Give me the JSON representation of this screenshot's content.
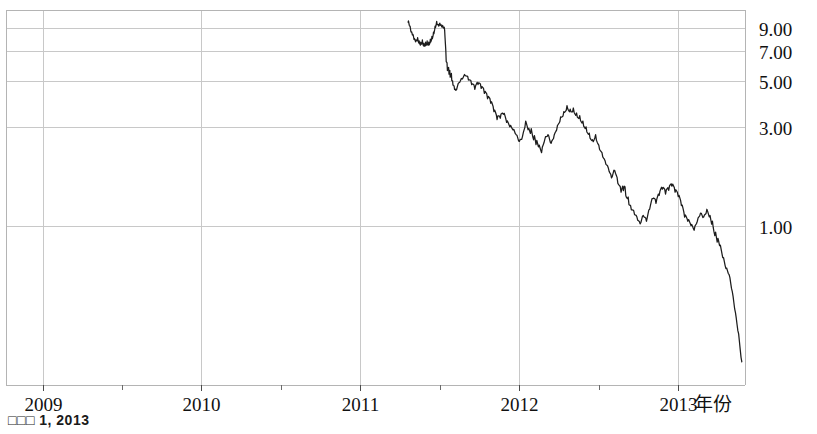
{
  "caption": {
    "text": "□□□ 1, 2013"
  },
  "chart_data": {
    "type": "line",
    "title": "",
    "subtitle": "",
    "xlabel": "年份",
    "ylabel": "",
    "yscale": "log",
    "grid": true,
    "legend": null,
    "xlim": [
      2008.77,
      2013.42
    ],
    "ylim": [
      0.17,
      11.0
    ],
    "x_tick_labels": [
      "2009",
      "2010",
      "2011",
      "2012",
      "2013"
    ],
    "x_tick_values": [
      2009,
      2010,
      2011,
      2012,
      2013
    ],
    "x_minor_ticks": [
      2009.5,
      2010.5,
      2011.5,
      2012.5
    ],
    "y_tick_labels": [
      "9.00",
      "7.00",
      "5.00",
      "3.00",
      "1.00"
    ],
    "y_tick_values": [
      9.0,
      7.0,
      5.0,
      3.0,
      1.0
    ],
    "series": [
      {
        "name": "price",
        "color": "#1c1c1c",
        "x": [
          2011.3,
          2011.31,
          2011.32,
          2011.33,
          2011.34,
          2011.35,
          2011.36,
          2011.37,
          2011.38,
          2011.39,
          2011.4,
          2011.41,
          2011.42,
          2011.43,
          2011.44,
          2011.45,
          2011.46,
          2011.47,
          2011.48,
          2011.49,
          2011.5,
          2011.51,
          2011.52,
          2011.53,
          2011.54,
          2011.55,
          2011.56,
          2011.57,
          2011.58,
          2011.59,
          2011.6,
          2011.62,
          2011.64,
          2011.66,
          2011.68,
          2011.7,
          2011.72,
          2011.74,
          2011.76,
          2011.78,
          2011.8,
          2011.82,
          2011.84,
          2011.86,
          2011.88,
          2011.9,
          2011.92,
          2011.94,
          2011.96,
          2011.98,
          2012.0,
          2012.02,
          2012.04,
          2012.06,
          2012.08,
          2012.1,
          2012.12,
          2012.14,
          2012.16,
          2012.18,
          2012.2,
          2012.22,
          2012.24,
          2012.26,
          2012.28,
          2012.3,
          2012.32,
          2012.34,
          2012.36,
          2012.38,
          2012.4,
          2012.42,
          2012.44,
          2012.46,
          2012.48,
          2012.5,
          2012.52,
          2012.54,
          2012.56,
          2012.58,
          2012.6,
          2012.62,
          2012.64,
          2012.66,
          2012.68,
          2012.7,
          2012.72,
          2012.74,
          2012.76,
          2012.78,
          2012.8,
          2012.82,
          2012.84,
          2012.86,
          2012.88,
          2012.9,
          2012.92,
          2012.94,
          2012.96,
          2012.98,
          2013.0,
          2013.02,
          2013.04,
          2013.06,
          2013.08,
          2013.1,
          2013.12,
          2013.14,
          2013.16,
          2013.18,
          2013.2,
          2013.22,
          2013.24,
          2013.26,
          2013.28,
          2013.3,
          2013.32,
          2013.34,
          2013.36,
          2013.38,
          2013.4
        ],
        "y": [
          9.6,
          9.2,
          8.6,
          8.4,
          8.0,
          7.9,
          8.1,
          7.8,
          7.7,
          7.9,
          7.6,
          7.7,
          7.8,
          7.7,
          7.95,
          8.2,
          8.6,
          9.2,
          9.7,
          9.35,
          9.5,
          9.2,
          9.1,
          8.8,
          6.2,
          5.7,
          5.5,
          5.3,
          5.0,
          4.7,
          4.5,
          4.9,
          5.1,
          5.3,
          5.05,
          4.8,
          4.55,
          4.8,
          4.6,
          4.35,
          4.1,
          3.9,
          3.55,
          3.25,
          3.3,
          3.45,
          3.15,
          3.0,
          2.9,
          2.75,
          2.55,
          2.7,
          3.2,
          2.95,
          2.8,
          2.6,
          2.4,
          2.25,
          2.6,
          2.75,
          2.5,
          2.75,
          3.05,
          3.35,
          3.55,
          3.8,
          3.65,
          3.7,
          3.5,
          3.4,
          3.2,
          3.0,
          2.8,
          2.6,
          2.75,
          2.45,
          2.25,
          2.05,
          1.9,
          1.7,
          1.85,
          1.6,
          1.45,
          1.55,
          1.35,
          1.25,
          1.18,
          1.1,
          1.02,
          1.12,
          1.05,
          1.2,
          1.35,
          1.28,
          1.4,
          1.5,
          1.42,
          1.48,
          1.55,
          1.45,
          1.38,
          1.25,
          1.1,
          1.05,
          1.0,
          0.95,
          1.05,
          1.15,
          1.1,
          1.2,
          1.12,
          0.98,
          0.88,
          0.8,
          0.7,
          0.62,
          0.58,
          0.48,
          0.38,
          0.3,
          0.22
        ]
      }
    ]
  }
}
